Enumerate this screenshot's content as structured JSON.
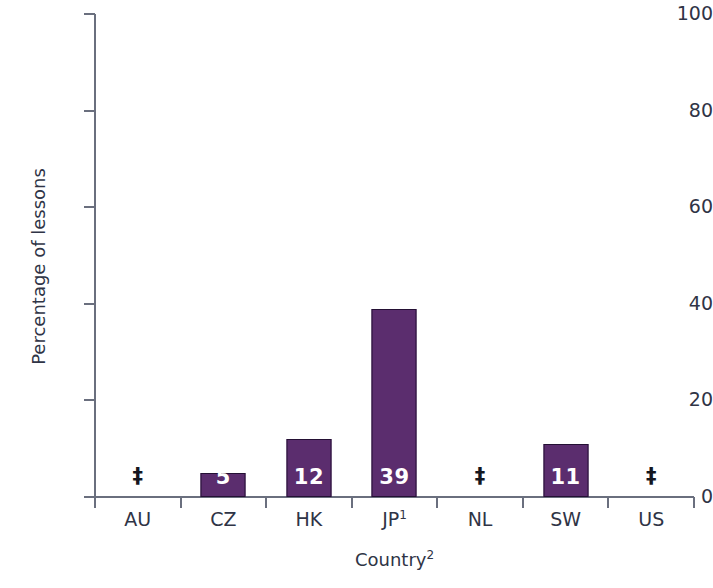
{
  "chart_data": {
    "type": "bar",
    "title": "",
    "xlabel": "Country",
    "xlabel_superscript": "2",
    "ylabel": "Percentage of lessons",
    "ylim": [
      0,
      100
    ],
    "yticks": [
      0,
      20,
      40,
      60,
      80,
      100
    ],
    "grid": false,
    "legend": "none",
    "categories": [
      "AU",
      "CZ",
      "HK",
      "JP",
      "NL",
      "SW",
      "US"
    ],
    "category_superscripts": [
      "",
      "",
      "",
      "1",
      "",
      "",
      ""
    ],
    "values": [
      null,
      5,
      12,
      39,
      null,
      11,
      null
    ],
    "data_labels": [
      "‡",
      "5",
      "12",
      "39",
      "‡",
      "11",
      "‡"
    ],
    "suppressed_symbol": "‡",
    "bars": [
      {
        "category": "AU",
        "label_text": "AU",
        "superscript": "",
        "value": null,
        "display": "‡",
        "suppressed": true
      },
      {
        "category": "CZ",
        "label_text": "CZ",
        "superscript": "",
        "value": 5,
        "display": "5",
        "suppressed": false
      },
      {
        "category": "HK",
        "label_text": "HK",
        "superscript": "",
        "value": 12,
        "display": "12",
        "suppressed": false
      },
      {
        "category": "JP",
        "label_text": "JP",
        "superscript": "1",
        "value": 39,
        "display": "39",
        "suppressed": false
      },
      {
        "category": "NL",
        "label_text": "NL",
        "superscript": "",
        "value": null,
        "display": "‡",
        "suppressed": true
      },
      {
        "category": "SW",
        "label_text": "SW",
        "superscript": "",
        "value": 11,
        "display": "11",
        "suppressed": false
      },
      {
        "category": "US",
        "label_text": "US",
        "superscript": "",
        "value": null,
        "display": "‡",
        "suppressed": true
      }
    ],
    "colors": {
      "bar_fill": "#5b2d6e",
      "bar_border": "#241034",
      "axis": "#6a6f7e",
      "text": "#2f3446",
      "bar_value_text": "#ffffff",
      "suppressed_text": "#14161f",
      "background": "#ffffff"
    }
  },
  "axes": {
    "y_tick_labels": [
      "0",
      "20",
      "40",
      "60",
      "80",
      "100"
    ],
    "y_title": "Percentage of lessons",
    "x_title": "Country",
    "x_title_superscript": "2"
  }
}
